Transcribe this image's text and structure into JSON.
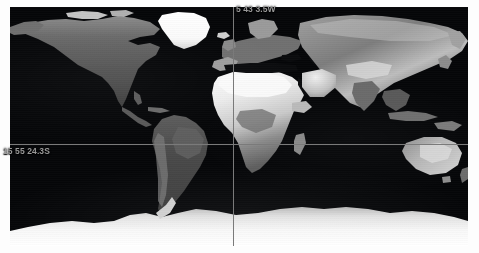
{
  "app": {
    "title": "World Map Coordinate Picker",
    "background_color": "#ffffff"
  },
  "map": {
    "name": "world-map",
    "projection": "equirectangular",
    "style": "grayscale-satellite",
    "ocean_color": "#050608",
    "land_color_low": "#3a3a3a",
    "land_color_high": "#f4f4f4",
    "ice_color": "#ffffff",
    "bounds": {
      "left": 10,
      "top": 7,
      "width": 458,
      "height": 239
    }
  },
  "crosshair": {
    "name": "coordinate-crosshair",
    "color": "#7a7a7a",
    "vertical_x": 223,
    "horizontal_y": 137
  },
  "readout": {
    "longitude": "5 43 3.5W",
    "latitude": "15 55 24.3S",
    "text_color": "#9a9a9a"
  }
}
